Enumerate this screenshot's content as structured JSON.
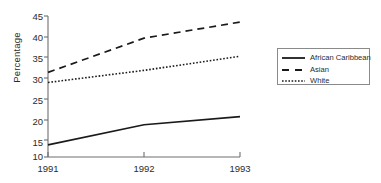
{
  "chart_data": {
    "type": "line",
    "title": "",
    "xlabel": "",
    "ylabel": "Percentage",
    "categories": [
      "1991",
      "1992",
      "1993"
    ],
    "x": [
      1991,
      1992,
      1993
    ],
    "xlim": [
      1991,
      1993
    ],
    "ylim": [
      10,
      45
    ],
    "yticks": [
      10,
      15,
      20,
      25,
      30,
      35,
      40,
      45
    ],
    "ytick_labels": [
      "10",
      "15",
      "20",
      "25",
      "30",
      "35",
      "40",
      "45"
    ],
    "xticks": [
      1991,
      1992,
      1993
    ],
    "xtick_labels": [
      "1991",
      "1992",
      "1993"
    ],
    "grid": false,
    "legend_position": "right",
    "series": [
      {
        "name": "African Caribbean",
        "style": "solid",
        "color": "#1a1a1a",
        "values": [
          13,
          18,
          20
        ]
      },
      {
        "name": "Asian",
        "style": "dashed",
        "color": "#1a1a1a",
        "values": [
          31,
          39.5,
          43.5
        ]
      },
      {
        "name": "White",
        "style": "dotted",
        "color": "#1a1a1a",
        "values": [
          28.5,
          31.5,
          35
        ]
      }
    ]
  },
  "axis": {
    "y_title": "Percentage",
    "y_tick_0": "45",
    "y_tick_1": "40",
    "y_tick_2": "35",
    "y_tick_3": "30",
    "y_tick_4": "25",
    "y_tick_5": "20",
    "y_tick_6": "15",
    "y_tick_7": "10",
    "x_tick_0": "1991",
    "x_tick_1": "1992",
    "x_tick_2": "1993"
  },
  "legend": {
    "item_0": "African Caribbean",
    "item_1": "Asian",
    "item_2": "White"
  },
  "colors": {
    "axis": "#6e6e6e",
    "line": "#1a1a1a",
    "text": "#2b2b2b",
    "legend_border": "#8a8a8a",
    "background": "#ffffff"
  }
}
